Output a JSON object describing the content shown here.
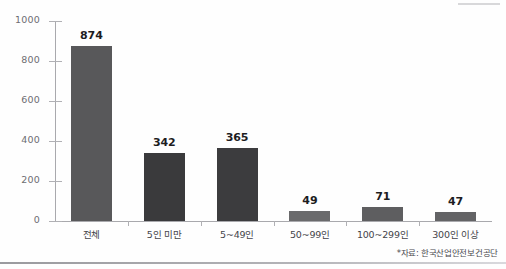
{
  "chart_data": {
    "type": "bar",
    "title": "",
    "xlabel": "",
    "ylabel": "",
    "ylim": [
      0,
      1000
    ],
    "grid": false,
    "legend": "none",
    "y_ticks": [
      0,
      200,
      400,
      600,
      800,
      1000
    ],
    "y_tick_labels": [
      "0",
      "200",
      "400",
      "600",
      "800",
      "1000"
    ],
    "categories": [
      "전체",
      "5인 미만",
      "5~49인",
      "50~99인",
      "100~299인",
      "300인 이상"
    ],
    "values": [
      874,
      342,
      365,
      49,
      71,
      47
    ],
    "value_labels": [
      "874",
      "342",
      "365",
      "49",
      "71",
      "47"
    ],
    "bar_colors": [
      "#58585a",
      "#3a3a3c",
      "#3c3c3e",
      "#6a6a6c",
      "#5e5e60",
      "#636365"
    ],
    "annotations": [
      "*자료: 한국산업안전보건공단"
    ]
  },
  "source": {
    "note": "*자료: 한국산업안전보건공단"
  }
}
